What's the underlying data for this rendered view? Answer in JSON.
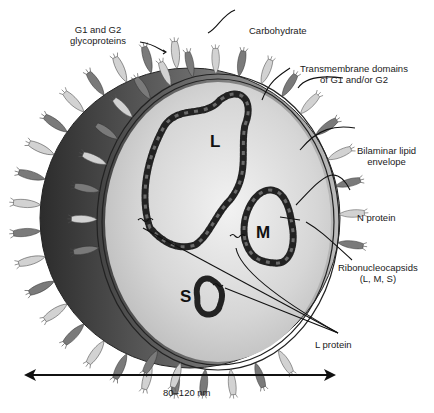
{
  "figure": {
    "labels": {
      "glycoproteins": [
        "G1 and G2",
        "glycoproteins"
      ],
      "carbohydrate": "Carbohydrate",
      "transmembrane": [
        "Transmembrane domains",
        "of G1 and/or G2"
      ],
      "lipid_envelope": [
        "Bilaminar lipid",
        "envelope"
      ],
      "n_protein": "N protein",
      "ribonucleocapsids": [
        "Ribonucleocapsids",
        "(L, M, S)"
      ],
      "l_protein": "L protein"
    },
    "segments": {
      "large": "L",
      "medium": "M",
      "small": "S"
    },
    "scale_bar": {
      "label": "80–120 nm"
    }
  },
  "colors": {
    "background": "#ffffff",
    "ink": "#1a1a1a",
    "spike_dark": "#6e6e6e",
    "spike_light": "#c9c9c9",
    "core_gray": "#cfcfcf",
    "crescent_dark": "#3a3a3a"
  }
}
